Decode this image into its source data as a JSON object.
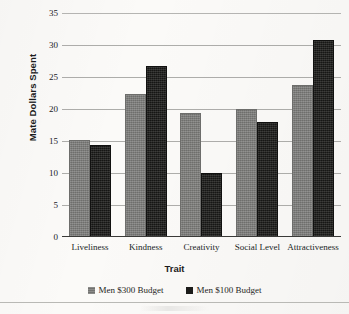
{
  "chart_data": {
    "type": "bar",
    "title": "",
    "xlabel": "Trait",
    "ylabel": "Mate Dollars Spent",
    "categories": [
      "Liveliness",
      "Kindness",
      "Creativity",
      "Social Level",
      "Attractiveness"
    ],
    "series": [
      {
        "name": "Men $300 Budget",
        "color": "#7c7c7a",
        "values": [
          15.2,
          22.3,
          19.3,
          20.0,
          23.8
        ]
      },
      {
        "name": "Men $100 Budget",
        "color": "#1c1c1a",
        "values": [
          14.3,
          26.7,
          10.0,
          18.0,
          30.8
        ]
      }
    ],
    "ylim": [
      0,
      35
    ],
    "ytick_labels": [
      "0",
      "5",
      "10",
      "15",
      "20",
      "25",
      "30",
      "35"
    ],
    "ytick_values": [
      0,
      5,
      10,
      15,
      20,
      25,
      30,
      35
    ],
    "grid": true,
    "legend_position": "bottom"
  },
  "legend": {
    "items": [
      {
        "label": "Men $300 Budget",
        "swatch": "gray-swatch"
      },
      {
        "label": "Men $100 Budget",
        "swatch": "black-swatch"
      }
    ]
  }
}
